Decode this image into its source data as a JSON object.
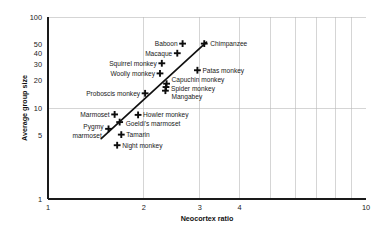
{
  "chart_data": {
    "type": "scatter",
    "title": "",
    "xlabel": "Neocortex ratio",
    "ylabel": "Average group size",
    "xscale": "log",
    "yscale": "log",
    "xlim": [
      1,
      10
    ],
    "ylim": [
      1,
      100
    ],
    "grid": true,
    "legend": null,
    "xticks": [
      {
        "value": 1,
        "label": "1"
      },
      {
        "value": 2,
        "label": "2"
      },
      {
        "value": 3,
        "label": "3"
      },
      {
        "value": 4,
        "label": "4"
      },
      {
        "value": 10,
        "label": "10"
      }
    ],
    "yticks": [
      {
        "value": 1,
        "label": "1"
      },
      {
        "value": 5,
        "label": "5"
      },
      {
        "value": 10,
        "label": "10"
      },
      {
        "value": 20,
        "label": "20"
      },
      {
        "value": 30,
        "label": "30"
      },
      {
        "value": 40,
        "label": "40"
      },
      {
        "value": 50,
        "label": "50"
      },
      {
        "value": 100,
        "label": "100"
      }
    ],
    "points": [
      {
        "name": "Chimpanzee",
        "x": 3.1,
        "y": 51,
        "label": "Chimpanzee",
        "anchor": "start",
        "dx": 6,
        "dy": 2.5
      },
      {
        "name": "Baboon",
        "x": 2.65,
        "y": 51,
        "label": "Baboon",
        "anchor": "end",
        "dx": -5,
        "dy": 2.5
      },
      {
        "name": "Macaque",
        "x": 2.55,
        "y": 40,
        "label": "Macaque",
        "anchor": "end",
        "dx": -5,
        "dy": 2.5
      },
      {
        "name": "Squirrel monkey",
        "x": 2.28,
        "y": 31,
        "label": "Squirrel monkey",
        "anchor": "end",
        "dx": -5,
        "dy": 2.5
      },
      {
        "name": "Patas monkey",
        "x": 2.95,
        "y": 26,
        "label": "Patas monkey",
        "anchor": "start",
        "dx": 5,
        "dy": 2.5
      },
      {
        "name": "Woolly monkey",
        "x": 2.25,
        "y": 24,
        "label": "Woolly monkey",
        "anchor": "end",
        "dx": -5,
        "dy": 2.5
      },
      {
        "name": "Capuchin monkey",
        "x": 2.36,
        "y": 18.5,
        "label": "Capuchin monkey",
        "anchor": "start",
        "dx": 5,
        "dy": -1.5
      },
      {
        "name": "Spider monkey",
        "x": 2.35,
        "y": 17,
        "label": "Spider monkey",
        "anchor": "start",
        "dx": 5,
        "dy": 3.5
      },
      {
        "name": "Mangabey",
        "x": 2.34,
        "y": 15.5,
        "label": "Mangabey",
        "anchor": "start",
        "dx": 6,
        "dy": 8.5
      },
      {
        "name": "Proboscis monkey",
        "x": 2.02,
        "y": 14.5,
        "label": "Proboscis monkey",
        "anchor": "end",
        "dx": -5,
        "dy": 2.5
      },
      {
        "name": "Marmoset",
        "x": 1.62,
        "y": 8.5,
        "label": "Marmoset",
        "anchor": "end",
        "dx": -5,
        "dy": 2.5
      },
      {
        "name": "Howler monkey",
        "x": 1.92,
        "y": 8.4,
        "label": "Howler monkey",
        "anchor": "start",
        "dx": 5,
        "dy": 2.5
      },
      {
        "name": "Goeldi's marmoset",
        "x": 1.68,
        "y": 7.0,
        "label": "Goeldi's marmoset",
        "anchor": "start",
        "dx": 6,
        "dy": 4.0
      },
      {
        "name": "Pygmy marmoset",
        "x": 1.55,
        "y": 5.9,
        "label": "Pygmy",
        "anchor": "end",
        "dx": -5,
        "dy": 0.5
      },
      {
        "name": "Tamarin",
        "x": 1.7,
        "y": 5.1,
        "label": "Tamarin",
        "anchor": "start",
        "dx": 5,
        "dy": 2.5
      },
      {
        "name": "Night monkey",
        "x": 1.65,
        "y": 3.9,
        "label": "Night monkey",
        "anchor": "start",
        "dx": 5,
        "dy": 2.5
      }
    ],
    "extra_labels": [
      {
        "name": "pygmy-marmoset-line2",
        "text": "marmoset",
        "x": 1.53,
        "y": 4.95,
        "anchor": "end",
        "dx": -5,
        "dy": 2.5
      }
    ],
    "fit_line": {
      "name": "regression-line",
      "x1": 1.47,
      "y1": 4.6,
      "x2": 3.15,
      "y2": 53
    }
  }
}
